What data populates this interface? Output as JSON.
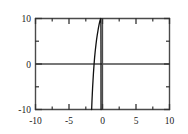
{
  "figure": {
    "background_color": "#ffffff",
    "frame_color": "#4a4a4a",
    "curve_color": "#111111",
    "axis_line_color": "#4a4a4a"
  },
  "chart_data": {
    "type": "line",
    "title": "",
    "subtitle": "",
    "xlabel": "",
    "ylabel": "",
    "xlim": [
      -10,
      10
    ],
    "ylim": [
      -10,
      10
    ],
    "grid": false,
    "legend": null,
    "legend_position": "none",
    "x_major_ticks": [
      -10,
      -5,
      0,
      5,
      10
    ],
    "x_minor_ticks": [
      -7.5,
      -2.5,
      2.5,
      7.5
    ],
    "x_tick_labels": [
      "-10",
      "-5",
      "0",
      "5",
      "10"
    ],
    "y_major_ticks": [
      -10,
      0,
      10
    ],
    "y_minor_ticks": [
      -5,
      5
    ],
    "y_tick_labels": [
      "-10",
      "0",
      "10"
    ],
    "axis_lines": [
      {
        "name": "y-zero-horizontal",
        "value": 0,
        "orientation": "horizontal"
      },
      {
        "name": "x-zero-vertical",
        "value": 0,
        "orientation": "vertical"
      }
    ],
    "series": [
      {
        "name": "curve",
        "color": "#111111",
        "linewidth": 1.3,
        "x": [
          -1.62,
          -1.6,
          -1.57,
          -1.53,
          -1.48,
          -1.42,
          -1.35,
          -1.27,
          -1.18,
          -1.08,
          -0.98,
          -0.88,
          -0.78,
          -0.68,
          -0.6,
          -0.52,
          -0.45,
          -0.39,
          -0.34,
          -0.3,
          -0.27,
          -0.25,
          -0.235,
          -0.228,
          -0.224,
          -0.222,
          -0.221,
          -0.22,
          -0.22,
          -0.22
        ],
        "y": [
          -10.0,
          -9.2,
          -8.1,
          -6.8,
          -5.3,
          -3.7,
          -2.0,
          -0.3,
          1.4,
          2.9,
          4.2,
          5.4,
          6.4,
          7.3,
          8.0,
          8.6,
          9.1,
          9.45,
          9.7,
          9.87,
          9.95,
          10.0,
          8.0,
          5.0,
          1.0,
          -3.0,
          -6.0,
          -8.5,
          -9.6,
          -10.0
        ]
      }
    ]
  },
  "labels": {
    "y_top": "10",
    "y_mid": "0",
    "y_bottom": "-10",
    "x_1": "-10",
    "x_2": "-5",
    "x_3": "0",
    "x_4": "5",
    "x_5": "10"
  }
}
